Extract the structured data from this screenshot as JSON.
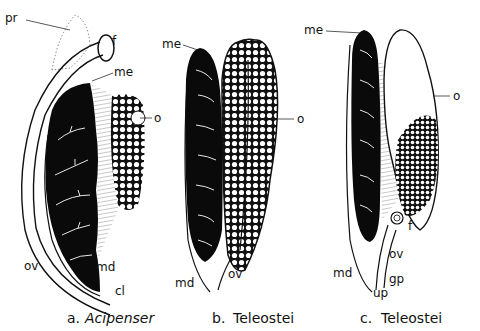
{
  "figure": {
    "panels": [
      {
        "id": "a",
        "caption_letter": "a.",
        "caption_taxon": "Acipenser",
        "labels": {
          "pr": "pr",
          "f": "f",
          "me": "me",
          "o": "o",
          "ov": "ov",
          "md": "md",
          "cl": "cl"
        }
      },
      {
        "id": "b",
        "caption_letter": "b.",
        "caption_taxon": "Teleostei",
        "labels": {
          "me": "me",
          "o": "o",
          "md": "md",
          "ov": "ov"
        }
      },
      {
        "id": "c",
        "caption_letter": "c.",
        "caption_taxon": "Teleostei",
        "labels": {
          "me": "me",
          "o": "o",
          "f": "f",
          "ov": "ov",
          "md": "md",
          "gp": "gp",
          "up": "up"
        }
      }
    ],
    "colors": {
      "ink": "#111111",
      "background": "#ffffff",
      "mesonephros_fill": "#0a0a0a"
    }
  }
}
